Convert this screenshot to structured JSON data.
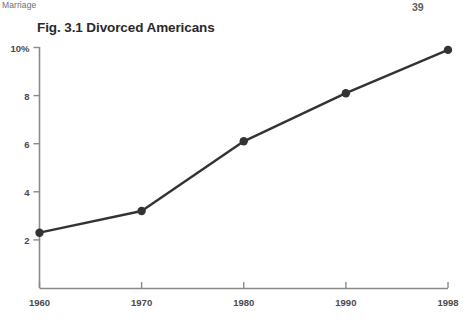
{
  "page": {
    "running_head": "Marriage",
    "page_number": "39"
  },
  "chart_data": {
    "type": "line",
    "title": "Fig. 3.1 Divorced Americans",
    "xlabel": "",
    "ylabel": "",
    "x": [
      "1960",
      "1970",
      "1980",
      "1990",
      "1998"
    ],
    "categories": [
      "1960",
      "1970",
      "1980",
      "1990",
      "1998"
    ],
    "values": [
      2.3,
      3.2,
      6.1,
      8.1,
      9.9
    ],
    "series": [
      {
        "name": "Divorced Americans",
        "values": [
          2.3,
          3.2,
          6.1,
          8.1,
          9.9
        ]
      }
    ],
    "ylim": [
      0,
      10
    ],
    "xtick_labels": [
      "1960",
      "1970",
      "1980",
      "1990",
      "1998"
    ],
    "ytick_labels": [
      "10%",
      "8",
      "6",
      "4",
      "2"
    ],
    "ytick_values": [
      10,
      8,
      6,
      4,
      2
    ],
    "grid": false,
    "legend": "none",
    "line_color": "#333333",
    "marker_color": "#333333",
    "axis_color": "#8a8a8a",
    "text_color": "#4a4a4a"
  }
}
